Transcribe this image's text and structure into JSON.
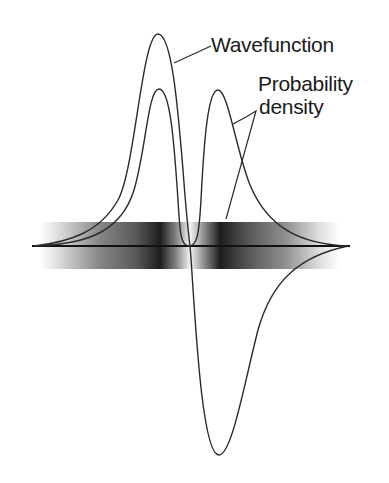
{
  "diagram": {
    "labels": {
      "wavefunction": "Wavefunction",
      "probability_line1": "Probability",
      "probability_line2": "density"
    },
    "colors": {
      "background": "#ffffff",
      "curve": "#2a2a2a",
      "axis": "#111111",
      "band_dark": "#1a1a1a"
    },
    "curves": [
      {
        "name": "wavefunction",
        "description": "One positive lobe on the left, one negative lobe on the right, crossing zero at the center"
      },
      {
        "name": "probability density",
        "description": "Two positive lobes of equal height, zero at the center node"
      }
    ],
    "band": {
      "description": "Horizontal shaded band whose darkness follows probability density"
    }
  }
}
